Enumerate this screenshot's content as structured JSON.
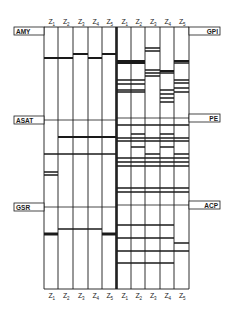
{
  "figure": {
    "type": "zymogram-diagram",
    "column_labels": [
      "Z1",
      "Z2",
      "Z3",
      "Z4",
      "Z5"
    ],
    "panels": [
      {
        "side": "left",
        "enzymes": [
          {
            "name": "AMY",
            "label_y": 31
          },
          {
            "name": "ASAT",
            "label_y": 120
          },
          {
            "name": "GSR",
            "label_y": 207
          }
        ]
      },
      {
        "side": "right",
        "enzymes": [
          {
            "name": "GPI",
            "label_y": 31
          },
          {
            "name": "PE",
            "label_y": 118
          },
          {
            "name": "ACP",
            "label_y": 205
          }
        ]
      }
    ],
    "colors": {
      "line": "#1a1a1a",
      "background": "#ffffff",
      "box": "#ffffff"
    }
  },
  "geometry": {
    "top": 27,
    "bottom": 289,
    "left_cols": [
      44,
      58,
      73,
      88,
      102,
      116
    ],
    "right_cols": [
      117,
      131,
      145,
      160,
      174,
      189
    ],
    "section_dividers_left": [
      120,
      207
    ],
    "section_dividers_right": [
      118,
      205
    ]
  },
  "bands": {
    "left": {
      "AMY": [
        [
          0,
          58,
          2
        ],
        [
          1,
          58,
          2
        ],
        [
          2,
          54,
          2
        ],
        [
          3,
          58,
          2
        ],
        [
          4,
          54,
          2
        ]
      ],
      "ASAT": [
        [
          1,
          137,
          2
        ],
        [
          2,
          137,
          2
        ],
        [
          3,
          137,
          2
        ],
        [
          4,
          137,
          2
        ],
        [
          0,
          154,
          1.5
        ],
        [
          1,
          154,
          1.5
        ],
        [
          2,
          154,
          1.5
        ],
        [
          3,
          154,
          1.5
        ],
        [
          4,
          154,
          1.5
        ],
        [
          0,
          172,
          1.5
        ],
        [
          0,
          175,
          1.5
        ]
      ],
      "GSR": [
        [
          0,
          234,
          3
        ],
        [
          1,
          229,
          1.5
        ],
        [
          2,
          229,
          1.5
        ],
        [
          3,
          229,
          1.5
        ],
        [
          4,
          234,
          3
        ]
      ]
    },
    "right": {
      "GPI": [
        [
          0,
          61,
          2
        ],
        [
          0,
          63,
          2
        ],
        [
          1,
          61,
          2
        ],
        [
          1,
          63,
          2
        ],
        [
          0,
          80,
          1.5
        ],
        [
          0,
          84,
          1.5
        ],
        [
          1,
          80,
          1.5
        ],
        [
          1,
          84,
          1.5
        ],
        [
          0,
          90,
          1.5
        ],
        [
          0,
          92,
          1.5
        ],
        [
          1,
          90,
          1.5
        ],
        [
          1,
          92,
          1.5
        ],
        [
          2,
          48,
          1.5
        ],
        [
          2,
          51,
          1.5
        ],
        [
          2,
          70,
          1.5
        ],
        [
          2,
          73,
          1.5
        ],
        [
          2,
          76,
          1.5
        ],
        [
          3,
          71,
          2
        ],
        [
          3,
          73,
          1.5
        ],
        [
          3,
          90,
          1.5
        ],
        [
          3,
          94,
          1.5
        ],
        [
          3,
          98,
          1.5
        ],
        [
          3,
          102,
          1.5
        ],
        [
          4,
          61,
          2
        ],
        [
          4,
          63,
          1.5
        ],
        [
          4,
          80,
          1.5
        ],
        [
          4,
          83,
          1.5
        ],
        [
          4,
          88,
          1.5
        ],
        [
          4,
          92,
          1.5
        ]
      ],
      "GPI_top": [
        [
          3,
          2,
          2
        ]
      ],
      "PE": [
        [
          0,
          125,
          1.5
        ],
        [
          1,
          125,
          1.5
        ],
        [
          2,
          125,
          1.5
        ],
        [
          3,
          125,
          1.5
        ],
        [
          4,
          125,
          1.5
        ],
        [
          1,
          134,
          1.5
        ],
        [
          3,
          134,
          1.5
        ],
        [
          0,
          138,
          1.5
        ],
        [
          0,
          141,
          1.5
        ],
        [
          1,
          138,
          1.5
        ],
        [
          1,
          141,
          1.5
        ],
        [
          2,
          138,
          1.5
        ],
        [
          2,
          141,
          1.5
        ],
        [
          3,
          138,
          1.5
        ],
        [
          3,
          141,
          1.5
        ],
        [
          4,
          138,
          1.5
        ],
        [
          4,
          141,
          1.5
        ],
        [
          1,
          147,
          1.5
        ],
        [
          3,
          147,
          1.5
        ],
        [
          2,
          154,
          1.5
        ],
        [
          4,
          154,
          1.5
        ],
        [
          0,
          158,
          1.5
        ],
        [
          1,
          158,
          1.5
        ],
        [
          2,
          158,
          1.5
        ],
        [
          3,
          158,
          1.5
        ],
        [
          4,
          158,
          1.5
        ],
        [
          0,
          162,
          1.5
        ],
        [
          1,
          162,
          1.5
        ],
        [
          2,
          162,
          1.5
        ],
        [
          3,
          162,
          1.5
        ],
        [
          4,
          162,
          1.5
        ],
        [
          0,
          166,
          1.5
        ],
        [
          1,
          166,
          1.5
        ],
        [
          2,
          166,
          1.5
        ],
        [
          3,
          166,
          1.5
        ],
        [
          4,
          166,
          1.5
        ],
        [
          0,
          188,
          1.5
        ],
        [
          1,
          188,
          1.5
        ],
        [
          2,
          188,
          1.5
        ],
        [
          3,
          188,
          1.5
        ],
        [
          4,
          188,
          1.5
        ],
        [
          0,
          192,
          1.5
        ],
        [
          1,
          192,
          1.5
        ],
        [
          2,
          192,
          1.5
        ],
        [
          3,
          192,
          1.5
        ],
        [
          4,
          192,
          1.5
        ]
      ],
      "ACP": [
        [
          0,
          225,
          1.5
        ],
        [
          1,
          225,
          1.5
        ],
        [
          2,
          225,
          1.5
        ],
        [
          3,
          225,
          1.5
        ],
        [
          0,
          238,
          1.5
        ],
        [
          1,
          238,
          1.5
        ],
        [
          2,
          238,
          1.5
        ],
        [
          3,
          238,
          1.5
        ],
        [
          4,
          243,
          1.5
        ],
        [
          0,
          251,
          1.5
        ],
        [
          1,
          251,
          1.5
        ],
        [
          2,
          251,
          1.5
        ],
        [
          3,
          251,
          1.5
        ],
        [
          4,
          251,
          1.5
        ],
        [
          0,
          263,
          1.5
        ],
        [
          1,
          263,
          1.5
        ],
        [
          2,
          263,
          1.5
        ],
        [
          3,
          263,
          1.5
        ]
      ]
    }
  }
}
